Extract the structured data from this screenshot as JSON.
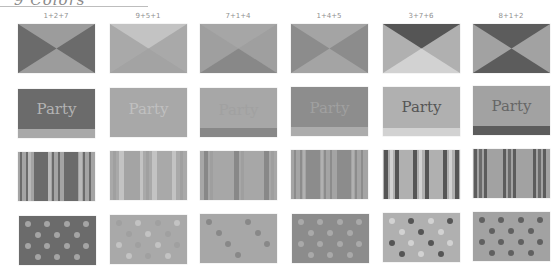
{
  "header": {
    "title": "9 Colors"
  },
  "palette": {
    "1": "#9c9c9c",
    "2": "#6b6b6b",
    "3": "#555555",
    "4": "#8c8c8c",
    "5": "#a9a9a9",
    "6": "#d2d2d2",
    "7": "#b0b0b0",
    "8": "#5c5c5c",
    "9": "#c3c3c3"
  },
  "columns": [
    {
      "label": "1+2+7"
    },
    {
      "label": "9+5+1"
    },
    {
      "label": "7+1+4"
    },
    {
      "label": "1+4+5"
    },
    {
      "label": "3+7+6"
    },
    {
      "label": "8+1+2"
    }
  ],
  "rows": [
    {
      "name": "bowtie"
    },
    {
      "name": "party-banner",
      "text": "Party"
    },
    {
      "name": "stripes"
    },
    {
      "name": "polka-dots"
    }
  ],
  "party": {
    "text": "Party"
  }
}
